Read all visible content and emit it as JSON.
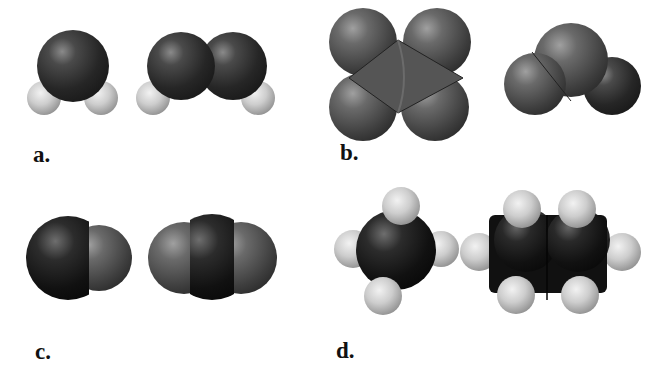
{
  "figure": {
    "colors": {
      "background": "#ffffff",
      "dark_atom": "#2a2a2a",
      "mid_atom": "#5a5a5a",
      "light_atom": "#c4c4c4",
      "label": "#111111"
    },
    "panels": [
      {
        "id": "a",
        "label": "a.",
        "models": [
          "bent triatomic (one large atom, two small light atoms)",
          "two large atoms each bonded to one small light atom"
        ]
      },
      {
        "id": "b",
        "label": "b.",
        "models": [
          "four large atoms around a central atom (tetrahedral view)",
          "three large atoms (trigonal)"
        ]
      },
      {
        "id": "c",
        "label": "c.",
        "models": [
          "diatomic (one dark, one lighter atom)",
          "linear triatomic (dark center, two lighter ends)"
        ]
      },
      {
        "id": "d",
        "label": "d.",
        "models": [
          "central dark atom with four small light atoms",
          "two dark atoms with six small light atoms"
        ]
      }
    ]
  }
}
